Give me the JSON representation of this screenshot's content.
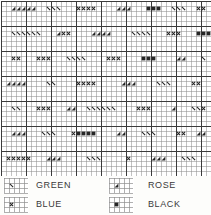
{
  "chart_data": {
    "type": "heatmap",
    "title": "",
    "xlabel": "",
    "ylabel": "",
    "grid": true,
    "legend_position": "bottom",
    "cell_px": 5,
    "heavy_every": 5,
    "cols": 42,
    "rows": 35,
    "grid_color": "#8f8f8f",
    "heavy_color": "#3b3b3b",
    "background": "#ffffff",
    "symbol_color": "#262626",
    "categories": [
      "green",
      "blue",
      "rose",
      "black"
    ],
    "symbols": {
      "green": "backslash",
      "blue": "cross",
      "rose": "filled-triangle",
      "black": "filled-square"
    },
    "marks": [
      {
        "row": 1,
        "col": 2,
        "sym": "rose"
      },
      {
        "row": 1,
        "col": 3,
        "sym": "rose"
      },
      {
        "row": 1,
        "col": 4,
        "sym": "rose"
      },
      {
        "row": 1,
        "col": 5,
        "sym": "rose"
      },
      {
        "row": 1,
        "col": 6,
        "sym": "rose"
      },
      {
        "row": 1,
        "col": 9,
        "sym": "green"
      },
      {
        "row": 1,
        "col": 10,
        "sym": "green"
      },
      {
        "row": 1,
        "col": 11,
        "sym": "green"
      },
      {
        "row": 1,
        "col": 15,
        "sym": "blue"
      },
      {
        "row": 1,
        "col": 16,
        "sym": "blue"
      },
      {
        "row": 1,
        "col": 17,
        "sym": "blue"
      },
      {
        "row": 1,
        "col": 18,
        "sym": "blue"
      },
      {
        "row": 1,
        "col": 23,
        "sym": "rose"
      },
      {
        "row": 1,
        "col": 24,
        "sym": "rose"
      },
      {
        "row": 1,
        "col": 25,
        "sym": "rose"
      },
      {
        "row": 1,
        "col": 29,
        "sym": "black"
      },
      {
        "row": 1,
        "col": 30,
        "sym": "black"
      },
      {
        "row": 1,
        "col": 31,
        "sym": "black"
      },
      {
        "row": 1,
        "col": 34,
        "sym": "green"
      },
      {
        "row": 1,
        "col": 35,
        "sym": "green"
      },
      {
        "row": 1,
        "col": 36,
        "sym": "green"
      },
      {
        "row": 1,
        "col": 39,
        "sym": "blue"
      },
      {
        "row": 1,
        "col": 40,
        "sym": "blue"
      },
      {
        "row": 6,
        "col": 2,
        "sym": "green"
      },
      {
        "row": 6,
        "col": 3,
        "sym": "green"
      },
      {
        "row": 6,
        "col": 4,
        "sym": "green"
      },
      {
        "row": 6,
        "col": 5,
        "sym": "green"
      },
      {
        "row": 6,
        "col": 6,
        "sym": "green"
      },
      {
        "row": 6,
        "col": 7,
        "sym": "green"
      },
      {
        "row": 6,
        "col": 11,
        "sym": "rose"
      },
      {
        "row": 6,
        "col": 12,
        "sym": "blue"
      },
      {
        "row": 6,
        "col": 13,
        "sym": "blue"
      },
      {
        "row": 6,
        "col": 18,
        "sym": "rose"
      },
      {
        "row": 6,
        "col": 19,
        "sym": "rose"
      },
      {
        "row": 6,
        "col": 20,
        "sym": "rose"
      },
      {
        "row": 6,
        "col": 21,
        "sym": "rose"
      },
      {
        "row": 6,
        "col": 26,
        "sym": "green"
      },
      {
        "row": 6,
        "col": 27,
        "sym": "green"
      },
      {
        "row": 6,
        "col": 28,
        "sym": "green"
      },
      {
        "row": 6,
        "col": 29,
        "sym": "green"
      },
      {
        "row": 6,
        "col": 33,
        "sym": "blue"
      },
      {
        "row": 6,
        "col": 34,
        "sym": "blue"
      },
      {
        "row": 6,
        "col": 35,
        "sym": "blue"
      },
      {
        "row": 6,
        "col": 39,
        "sym": "black"
      },
      {
        "row": 6,
        "col": 40,
        "sym": "black"
      },
      {
        "row": 6,
        "col": 41,
        "sym": "black"
      },
      {
        "row": 11,
        "col": 2,
        "sym": "blue"
      },
      {
        "row": 11,
        "col": 3,
        "sym": "blue"
      },
      {
        "row": 11,
        "col": 7,
        "sym": "blue"
      },
      {
        "row": 11,
        "col": 8,
        "sym": "blue"
      },
      {
        "row": 11,
        "col": 9,
        "sym": "blue"
      },
      {
        "row": 11,
        "col": 13,
        "sym": "green"
      },
      {
        "row": 11,
        "col": 14,
        "sym": "green"
      },
      {
        "row": 11,
        "col": 15,
        "sym": "green"
      },
      {
        "row": 11,
        "col": 16,
        "sym": "green"
      },
      {
        "row": 11,
        "col": 21,
        "sym": "blue"
      },
      {
        "row": 11,
        "col": 22,
        "sym": "blue"
      },
      {
        "row": 11,
        "col": 23,
        "sym": "blue"
      },
      {
        "row": 11,
        "col": 28,
        "sym": "black"
      },
      {
        "row": 11,
        "col": 29,
        "sym": "black"
      },
      {
        "row": 11,
        "col": 30,
        "sym": "black"
      },
      {
        "row": 11,
        "col": 35,
        "sym": "rose"
      },
      {
        "row": 11,
        "col": 36,
        "sym": "rose"
      },
      {
        "row": 11,
        "col": 40,
        "sym": "green"
      },
      {
        "row": 16,
        "col": 1,
        "sym": "rose"
      },
      {
        "row": 16,
        "col": 2,
        "sym": "rose"
      },
      {
        "row": 16,
        "col": 3,
        "sym": "rose"
      },
      {
        "row": 16,
        "col": 4,
        "sym": "rose"
      },
      {
        "row": 16,
        "col": 9,
        "sym": "green"
      },
      {
        "row": 16,
        "col": 10,
        "sym": "green"
      },
      {
        "row": 16,
        "col": 15,
        "sym": "blue"
      },
      {
        "row": 16,
        "col": 16,
        "sym": "blue"
      },
      {
        "row": 16,
        "col": 17,
        "sym": "blue"
      },
      {
        "row": 16,
        "col": 18,
        "sym": "blue"
      },
      {
        "row": 16,
        "col": 24,
        "sym": "rose"
      },
      {
        "row": 16,
        "col": 25,
        "sym": "rose"
      },
      {
        "row": 16,
        "col": 26,
        "sym": "rose"
      },
      {
        "row": 16,
        "col": 31,
        "sym": "green"
      },
      {
        "row": 16,
        "col": 32,
        "sym": "green"
      },
      {
        "row": 16,
        "col": 33,
        "sym": "green"
      },
      {
        "row": 16,
        "col": 38,
        "sym": "blue"
      },
      {
        "row": 16,
        "col": 39,
        "sym": "blue"
      },
      {
        "row": 21,
        "col": 2,
        "sym": "green"
      },
      {
        "row": 21,
        "col": 3,
        "sym": "green"
      },
      {
        "row": 21,
        "col": 7,
        "sym": "blue"
      },
      {
        "row": 21,
        "col": 8,
        "sym": "blue"
      },
      {
        "row": 21,
        "col": 9,
        "sym": "blue"
      },
      {
        "row": 21,
        "col": 13,
        "sym": "rose"
      },
      {
        "row": 21,
        "col": 14,
        "sym": "rose"
      },
      {
        "row": 21,
        "col": 17,
        "sym": "green"
      },
      {
        "row": 21,
        "col": 18,
        "sym": "green"
      },
      {
        "row": 21,
        "col": 19,
        "sym": "green"
      },
      {
        "row": 21,
        "col": 20,
        "sym": "green"
      },
      {
        "row": 21,
        "col": 21,
        "sym": "green"
      },
      {
        "row": 21,
        "col": 22,
        "sym": "green"
      },
      {
        "row": 21,
        "col": 27,
        "sym": "blue"
      },
      {
        "row": 21,
        "col": 28,
        "sym": "blue"
      },
      {
        "row": 21,
        "col": 29,
        "sym": "blue"
      },
      {
        "row": 21,
        "col": 34,
        "sym": "rose"
      },
      {
        "row": 21,
        "col": 38,
        "sym": "green"
      },
      {
        "row": 21,
        "col": 39,
        "sym": "green"
      },
      {
        "row": 21,
        "col": 40,
        "sym": "blue"
      },
      {
        "row": 26,
        "col": 2,
        "sym": "rose"
      },
      {
        "row": 26,
        "col": 3,
        "sym": "rose"
      },
      {
        "row": 26,
        "col": 4,
        "sym": "rose"
      },
      {
        "row": 26,
        "col": 8,
        "sym": "green"
      },
      {
        "row": 26,
        "col": 9,
        "sym": "green"
      },
      {
        "row": 26,
        "col": 10,
        "sym": "green"
      },
      {
        "row": 26,
        "col": 14,
        "sym": "blue"
      },
      {
        "row": 26,
        "col": 15,
        "sym": "black"
      },
      {
        "row": 26,
        "col": 16,
        "sym": "black"
      },
      {
        "row": 26,
        "col": 17,
        "sym": "black"
      },
      {
        "row": 26,
        "col": 18,
        "sym": "black"
      },
      {
        "row": 26,
        "col": 23,
        "sym": "rose"
      },
      {
        "row": 26,
        "col": 24,
        "sym": "rose"
      },
      {
        "row": 26,
        "col": 28,
        "sym": "green"
      },
      {
        "row": 26,
        "col": 29,
        "sym": "green"
      },
      {
        "row": 26,
        "col": 30,
        "sym": "green"
      },
      {
        "row": 26,
        "col": 35,
        "sym": "blue"
      },
      {
        "row": 26,
        "col": 36,
        "sym": "blue"
      },
      {
        "row": 26,
        "col": 39,
        "sym": "rose"
      },
      {
        "row": 26,
        "col": 40,
        "sym": "rose"
      },
      {
        "row": 31,
        "col": 1,
        "sym": "blue"
      },
      {
        "row": 31,
        "col": 2,
        "sym": "blue"
      },
      {
        "row": 31,
        "col": 3,
        "sym": "blue"
      },
      {
        "row": 31,
        "col": 4,
        "sym": "blue"
      },
      {
        "row": 31,
        "col": 5,
        "sym": "blue"
      },
      {
        "row": 31,
        "col": 9,
        "sym": "rose"
      },
      {
        "row": 31,
        "col": 10,
        "sym": "rose"
      },
      {
        "row": 31,
        "col": 11,
        "sym": "rose"
      },
      {
        "row": 31,
        "col": 17,
        "sym": "green"
      },
      {
        "row": 31,
        "col": 18,
        "sym": "green"
      },
      {
        "row": 31,
        "col": 19,
        "sym": "green"
      },
      {
        "row": 31,
        "col": 25,
        "sym": "blue"
      },
      {
        "row": 31,
        "col": 30,
        "sym": "rose"
      },
      {
        "row": 31,
        "col": 31,
        "sym": "rose"
      },
      {
        "row": 31,
        "col": 32,
        "sym": "rose"
      },
      {
        "row": 31,
        "col": 36,
        "sym": "green"
      },
      {
        "row": 31,
        "col": 37,
        "sym": "green"
      },
      {
        "row": 31,
        "col": 38,
        "sym": "green"
      }
    ]
  },
  "legend": {
    "entries": [
      {
        "symbol": "backslash",
        "label": "GREEN"
      },
      {
        "symbol": "cross",
        "label": "BLUE"
      },
      {
        "symbol": "filled-triangle",
        "label": "ROSE"
      },
      {
        "symbol": "filled-square",
        "label": "BLACK"
      }
    ]
  }
}
